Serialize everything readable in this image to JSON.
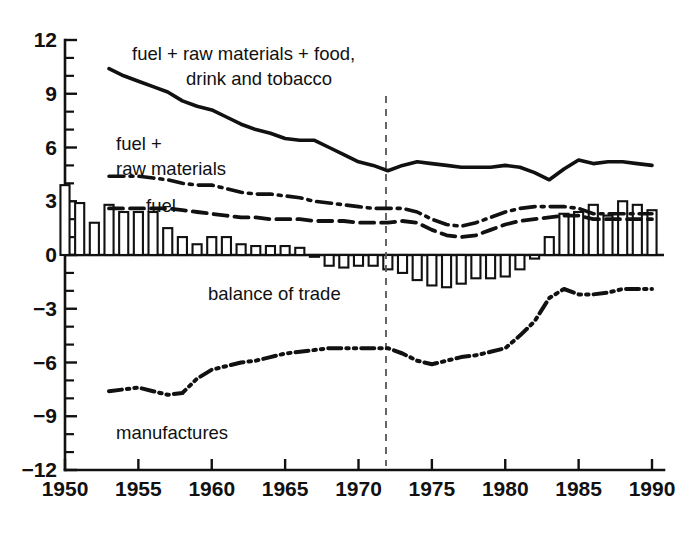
{
  "chart_data": {
    "type": "line",
    "title": "",
    "subtitle": "",
    "xlabel": "",
    "ylabel": "",
    "xlim": [
      1950,
      1990
    ],
    "ylim": [
      -12,
      12
    ],
    "grid": false,
    "legend_position": "inline-annotations",
    "x_ticks": [
      1950,
      1955,
      1960,
      1965,
      1970,
      1975,
      1980,
      1985,
      1990
    ],
    "x_tick_labels": [
      "1950",
      "1955",
      "1960",
      "1965",
      "1970",
      "1975",
      "1980",
      "1985",
      "1990"
    ],
    "x_minor_tick_step": 1,
    "y_ticks": [
      -12,
      -9,
      -6,
      -3,
      0,
      3,
      6,
      9,
      12
    ],
    "y_tick_labels": [
      "−12",
      "−9",
      "−6",
      "−3",
      "0",
      "3",
      "6",
      "9",
      "12"
    ],
    "y_minor_tick_step": 1,
    "annotations": [
      {
        "id": "vline-1972",
        "type": "vertical-dashed-line",
        "x": 1972,
        "label": ""
      }
    ],
    "series": [
      {
        "name": "fuel + raw materials + food, drink and tobacco",
        "label_text_line1": "fuel + raw materials + food,",
        "label_text_line2": "drink and tobacco",
        "style": "solid",
        "x": [
          1953,
          1954,
          1955,
          1956,
          1957,
          1958,
          1959,
          1960,
          1961,
          1962,
          1963,
          1964,
          1965,
          1966,
          1967,
          1968,
          1969,
          1970,
          1971,
          1972,
          1973,
          1974,
          1975,
          1976,
          1977,
          1978,
          1979,
          1980,
          1981,
          1982,
          1983,
          1984,
          1985,
          1986,
          1987,
          1988,
          1989,
          1990
        ],
        "values": [
          10.4,
          10.0,
          9.7,
          9.4,
          9.1,
          8.6,
          8.3,
          8.1,
          7.7,
          7.3,
          7.0,
          6.8,
          6.5,
          6.4,
          6.4,
          6.0,
          5.6,
          5.2,
          5.0,
          4.7,
          5.0,
          5.2,
          5.1,
          5.0,
          4.9,
          4.9,
          4.9,
          5.0,
          4.9,
          4.6,
          4.2,
          4.8,
          5.3,
          5.1,
          5.2,
          5.2,
          5.1,
          5.0
        ]
      },
      {
        "name": "fuel + raw materials",
        "label_text_line1": "fuel +",
        "label_text_line2": "raw materials",
        "style": "dash-dot",
        "x": [
          1953,
          1954,
          1955,
          1956,
          1957,
          1958,
          1959,
          1960,
          1961,
          1962,
          1963,
          1964,
          1965,
          1966,
          1967,
          1968,
          1969,
          1970,
          1971,
          1972,
          1973,
          1974,
          1975,
          1976,
          1977,
          1978,
          1979,
          1980,
          1981,
          1982,
          1983,
          1984,
          1985,
          1986,
          1987,
          1988,
          1989,
          1990
        ],
        "values": [
          4.4,
          4.4,
          4.4,
          4.3,
          4.2,
          4.0,
          3.9,
          3.9,
          3.7,
          3.5,
          3.4,
          3.4,
          3.3,
          3.2,
          3.0,
          2.9,
          2.8,
          2.7,
          2.6,
          2.6,
          2.6,
          2.4,
          2.0,
          1.7,
          1.6,
          1.8,
          2.1,
          2.4,
          2.6,
          2.7,
          2.7,
          2.7,
          2.6,
          2.3,
          2.3,
          2.3,
          2.3,
          2.3
        ]
      },
      {
        "name": "fuel",
        "label_text_line1": "fuel",
        "label_text_line2": "",
        "style": "dashed",
        "x": [
          1953,
          1954,
          1955,
          1956,
          1957,
          1958,
          1959,
          1960,
          1961,
          1962,
          1963,
          1964,
          1965,
          1966,
          1967,
          1968,
          1969,
          1970,
          1971,
          1972,
          1973,
          1974,
          1975,
          1976,
          1977,
          1978,
          1979,
          1980,
          1981,
          1982,
          1983,
          1984,
          1985,
          1986,
          1987,
          1988,
          1989,
          1990
        ],
        "values": [
          2.6,
          2.6,
          2.6,
          2.6,
          2.6,
          2.5,
          2.4,
          2.3,
          2.2,
          2.1,
          2.1,
          2.0,
          2.0,
          2.0,
          1.9,
          1.9,
          1.9,
          1.8,
          1.8,
          1.8,
          1.9,
          1.8,
          1.4,
          1.1,
          1.0,
          1.1,
          1.4,
          1.7,
          1.9,
          2.0,
          2.1,
          2.2,
          2.2,
          2.0,
          2.0,
          2.0,
          2.0,
          2.0
        ]
      },
      {
        "name": "manufactures",
        "label_text_line1": "manufactures",
        "label_text_line2": "",
        "style": "dash-dot-dot",
        "x": [
          1953,
          1954,
          1955,
          1956,
          1957,
          1958,
          1959,
          1960,
          1961,
          1962,
          1963,
          1964,
          1965,
          1966,
          1967,
          1968,
          1969,
          1970,
          1971,
          1972,
          1973,
          1974,
          1975,
          1976,
          1977,
          1978,
          1979,
          1980,
          1981,
          1982,
          1983,
          1984,
          1985,
          1986,
          1987,
          1988,
          1989,
          1990
        ],
        "values": [
          -7.6,
          -7.5,
          -7.4,
          -7.6,
          -7.8,
          -7.7,
          -6.9,
          -6.4,
          -6.2,
          -6.0,
          -5.9,
          -5.7,
          -5.5,
          -5.4,
          -5.3,
          -5.2,
          -5.2,
          -5.2,
          -5.2,
          -5.2,
          -5.5,
          -5.9,
          -6.1,
          -5.9,
          -5.7,
          -5.6,
          -5.4,
          -5.2,
          -4.5,
          -3.7,
          -2.4,
          -1.9,
          -2.2,
          -2.2,
          -2.1,
          -1.9,
          -1.9,
          -1.9
        ]
      }
    ],
    "bar_series": {
      "name": "balance of trade",
      "label_text": "balance of trade",
      "style": "open-bars",
      "x": [
        1950,
        1951,
        1952,
        1953,
        1954,
        1955,
        1956,
        1957,
        1958,
        1959,
        1960,
        1961,
        1962,
        1963,
        1964,
        1965,
        1966,
        1967,
        1968,
        1969,
        1970,
        1971,
        1972,
        1973,
        1974,
        1975,
        1976,
        1977,
        1978,
        1979,
        1980,
        1981,
        1982,
        1983,
        1984,
        1985,
        1986,
        1987,
        1988,
        1989,
        1990
      ],
      "values": [
        3.9,
        2.9,
        1.8,
        2.8,
        2.4,
        2.4,
        2.4,
        1.5,
        1.0,
        0.6,
        1.0,
        1.0,
        0.6,
        0.5,
        0.5,
        0.5,
        0.4,
        -0.1,
        -0.6,
        -0.7,
        -0.6,
        -0.6,
        -0.8,
        -1.0,
        -1.4,
        -1.7,
        -1.8,
        -1.6,
        -1.3,
        -1.3,
        -1.2,
        -0.8,
        -0.2,
        1.0,
        2.3,
        2.4,
        2.8,
        2.2,
        3.0,
        2.8,
        2.5
      ]
    }
  },
  "axes": {
    "y_axis_name": "y-axis",
    "x_axis_name": "x-axis"
  }
}
